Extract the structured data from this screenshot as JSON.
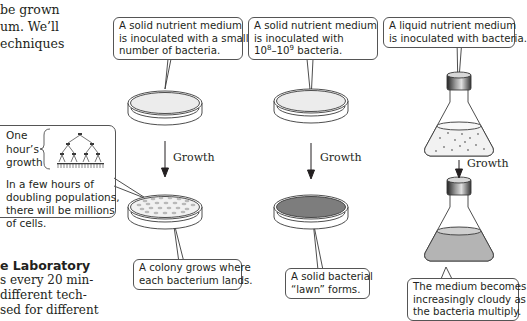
{
  "intro_text": {
    "lines": [
      "be grown",
      "um. We’ll",
      "echniques"
    ]
  },
  "section_text": {
    "heading": "e Laboratory",
    "lines": [
      "s every 20 min-",
      "different tech-",
      "sed for different"
    ]
  },
  "columns": [
    {
      "top_callout": [
        "A solid nutrient medium",
        "is inoculated with a small",
        "number of bacteria."
      ],
      "arrow_label": "Growth",
      "bottom_callout": [
        "A colony grows where",
        "each bacterium lands."
      ]
    },
    {
      "top_callout_line1": "A solid nutrient medium",
      "top_callout_line2": "is inoculated with",
      "top_callout_line3_base1": "10",
      "top_callout_line3_sup1": "8",
      "top_callout_line3_dash": "–10",
      "top_callout_line3_sup2": "9",
      "top_callout_line3_rest": " bacteria.",
      "arrow_label": "Growth",
      "bottom_callout": [
        "A solid bacterial",
        "“lawn” forms."
      ]
    },
    {
      "top_callout": [
        "A liquid nutrient medium",
        "is inoculated with bacteria."
      ],
      "arrow_label": "Growth",
      "bottom_callout": [
        "The medium becomes",
        "increasingly cloudy as",
        "the bacteria multiply."
      ]
    }
  ],
  "growth_box": {
    "brace_label": [
      "One",
      "hour’s",
      "growth"
    ],
    "description": [
      "In a few hours of",
      "doubling populations,",
      "there will be millions",
      "of cells."
    ]
  },
  "colors": {
    "stroke": "#3a3a3a",
    "lawn": "#7d7d7d",
    "colony": "#b9b9b9",
    "medium": "#ececec",
    "cloudy": "#b4b4b4"
  }
}
